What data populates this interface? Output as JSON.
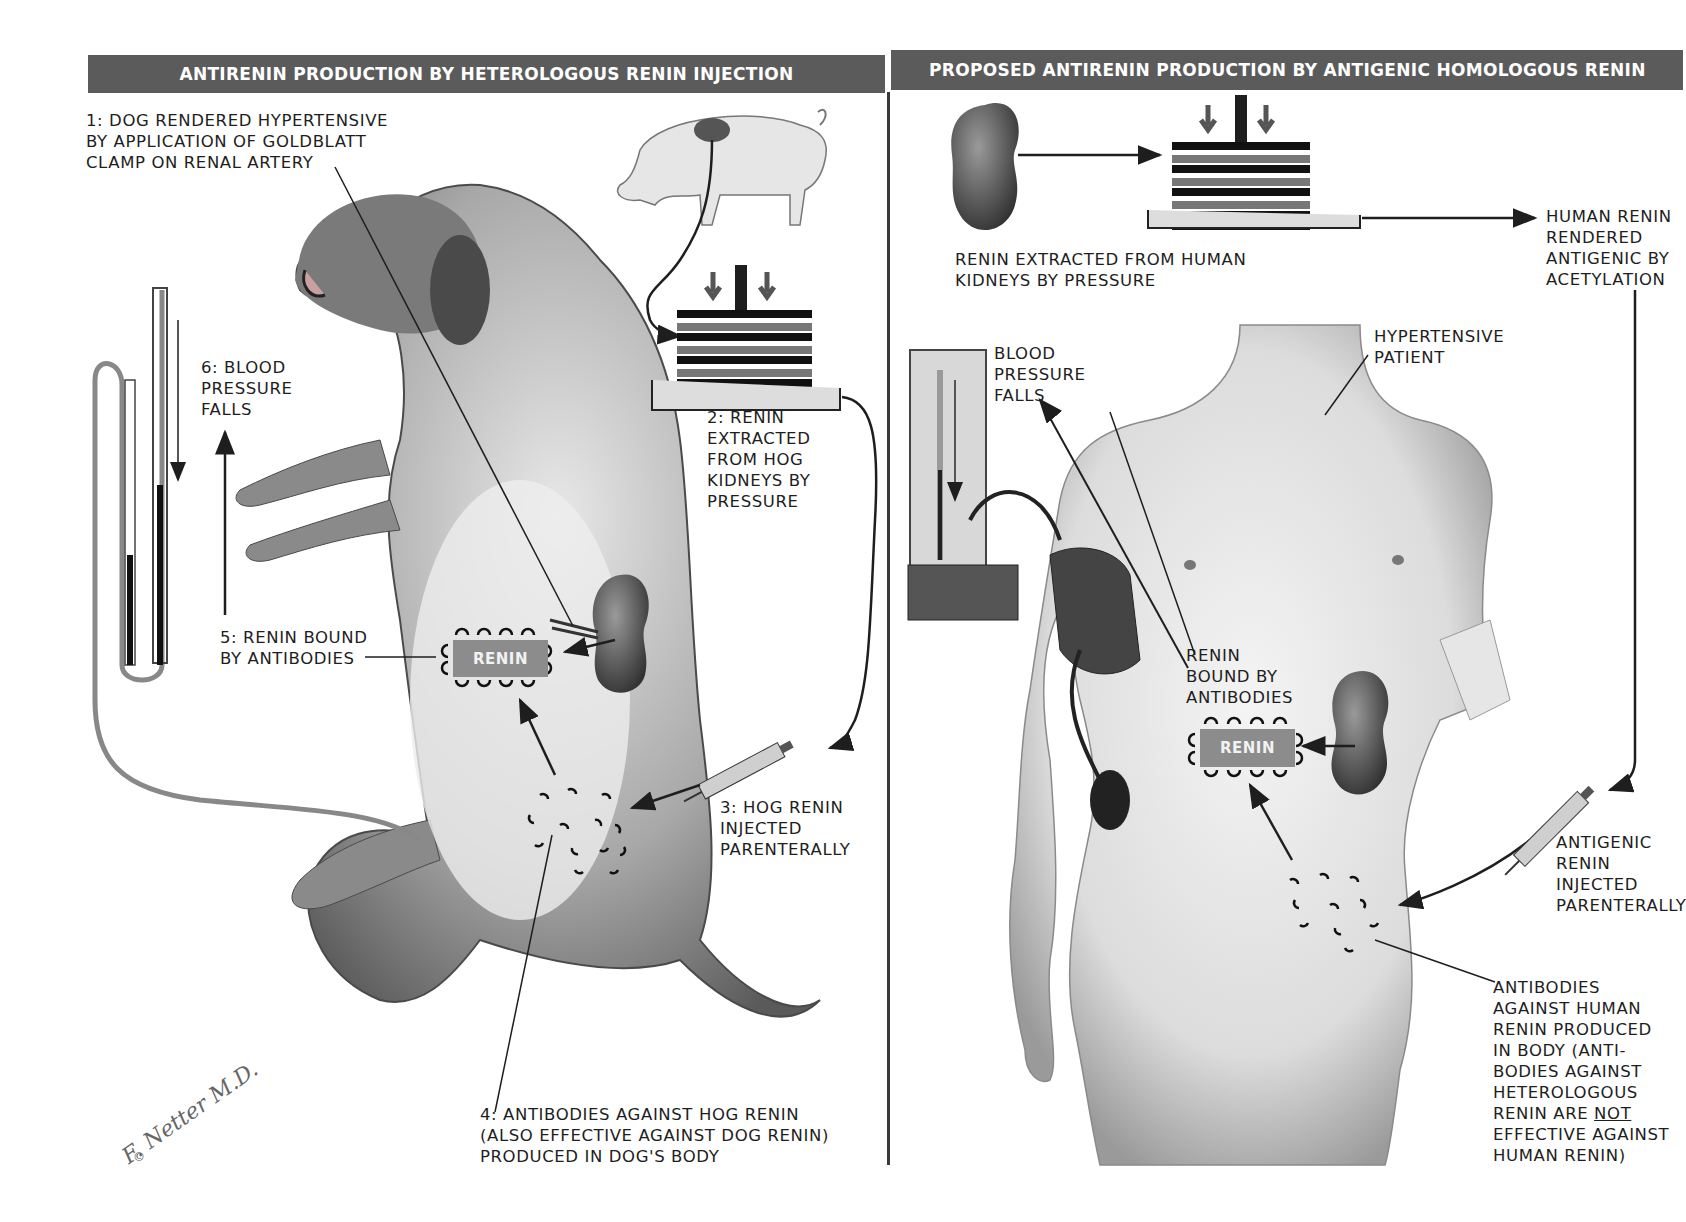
{
  "headers": {
    "left": "ANTIRENIN PRODUCTION BY HETEROLOGOUS RENIN INJECTION",
    "right": "PROPOSED ANTIRENIN PRODUCTION BY ANTIGENIC HOMOLOGOUS RENIN"
  },
  "left_panel": {
    "step1": "1: DOG RENDERED HYPERTENSIVE\nBY APPLICATION OF GOLDBLATT\nCLAMP ON RENAL ARTERY",
    "step2": "2: RENIN\nEXTRACTED\nFROM HOG\nKIDNEYS BY\nPRESSURE",
    "step3": "3: HOG RENIN\nINJECTED\nPARENTERALLY",
    "step4": "4: ANTIBODIES AGAINST HOG RENIN\n(ALSO EFFECTIVE AGAINST DOG RENIN)\nPRODUCED IN DOG'S BODY",
    "step5": "5: RENIN BOUND\nBY ANTIBODIES",
    "step6": "6: BLOOD\nPRESSURE\nFALLS",
    "renin_box": "RENIN"
  },
  "right_panel": {
    "extracted": "RENIN EXTRACTED FROM HUMAN\nKIDNEYS BY PRESSURE",
    "acetylation": "HUMAN RENIN\nRENDERED\nANTIGENIC BY\nACETYLATION",
    "bp_falls": "BLOOD\nPRESSURE\nFALLS",
    "patient": "HYPERTENSIVE\nPATIENT",
    "bound": "RENIN\nBOUND BY\nANTIBODIES",
    "renin_box": "RENIN",
    "injected": "ANTIGENIC\nRENIN\nINJECTED\nPARENTERALLY",
    "antibodies_pre": "ANTIBODIES\nAGAINST HUMAN\nRENIN PRODUCED\nIN BODY (ANTI-\nBODIES AGAINST\nHETEROLOGOUS\nRENIN ARE ",
    "antibodies_not": "NOT",
    "antibodies_post": "\nEFFECTIVE AGAINST\nHUMAN RENIN)"
  },
  "signature": {
    "name": "F. Netter M.D.",
    "copyright": "©"
  },
  "colors": {
    "header_bg": "#5b5b5b",
    "renin_box": "#8c8c8c",
    "line": "#1e1e1e"
  }
}
